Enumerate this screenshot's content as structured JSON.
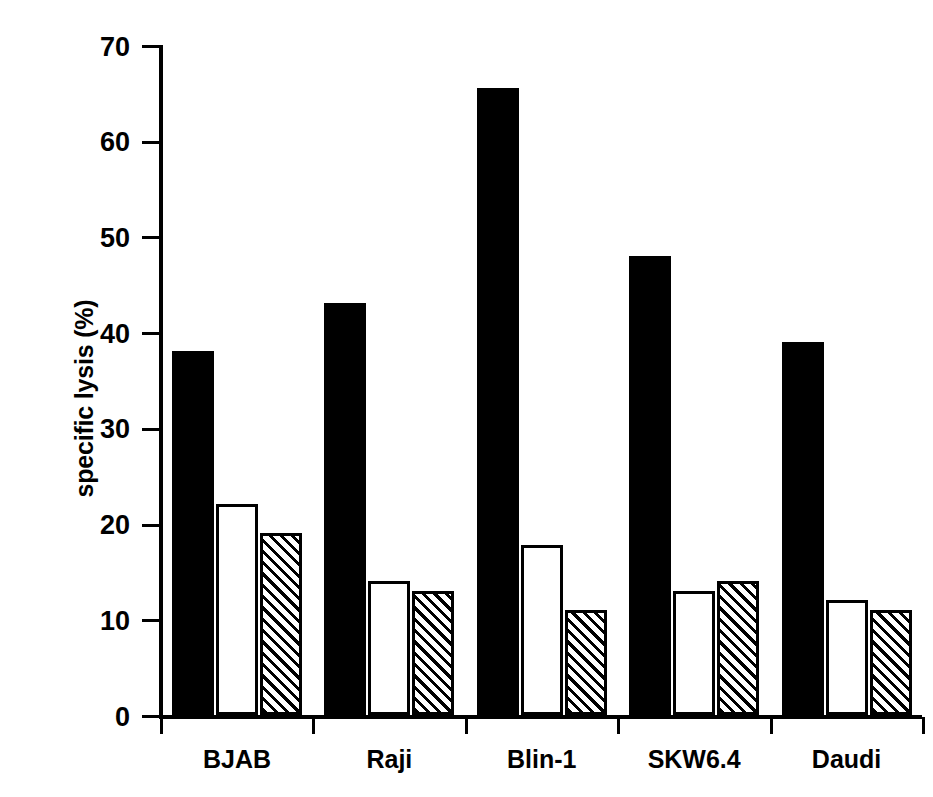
{
  "chart_data": {
    "type": "bar",
    "title": "",
    "subtitle": "",
    "xlabel": "",
    "ylabel": "specific lysis (%)",
    "categories": [
      "BJAB",
      "Raji",
      "Blin-1",
      "SKW6.4",
      "Daudi"
    ],
    "series": [
      {
        "name": "solid-black-bar",
        "fill": "solid black",
        "values": [
          38,
          43,
          65.5,
          48,
          39
        ]
      },
      {
        "name": "open-white-bar",
        "fill": "open white",
        "values": [
          22,
          14,
          17.8,
          13,
          12
        ]
      },
      {
        "name": "hatched-bar",
        "fill": "diagonal hatch",
        "values": [
          19,
          13,
          11,
          14,
          11
        ]
      }
    ],
    "ylim": [
      0,
      70
    ],
    "ytick_values": [
      0,
      10,
      20,
      30,
      40,
      50,
      60,
      70
    ],
    "ytick_labels": [
      "0",
      "10",
      "20",
      "30",
      "40",
      "50",
      "60",
      "70"
    ],
    "grid": false,
    "legend": "none",
    "legend_position": "none",
    "annotations": []
  },
  "colors": {
    "foreground": "#000000",
    "background": "#ffffff",
    "bar_solid": "#000000",
    "bar_open_fill": "#ffffff",
    "bar_open_stroke": "#000000",
    "bar_hatch_stroke": "#000000"
  }
}
